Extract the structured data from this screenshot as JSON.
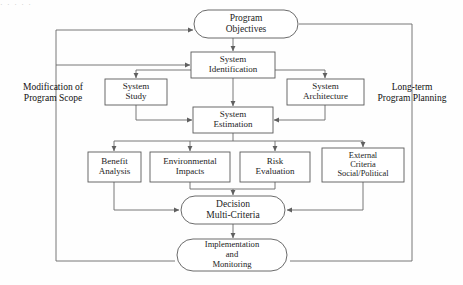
{
  "page": {
    "width": 463,
    "height": 285,
    "background_color": "#fefefe",
    "top_fragment_text": "· ·  ·   ·    ·"
  },
  "colors": {
    "node_stroke": "#5a5a5a",
    "node_fill": "#ffffff",
    "connector": "#6a6a6a",
    "text": "#1c1c1c"
  },
  "diagram": {
    "type": "flowchart",
    "title_visible": false,
    "nodes": [
      {
        "id": "program-objectives",
        "label_lines": [
          "Program",
          "Objectives"
        ],
        "shape": "stadium",
        "x": 194,
        "y": 10,
        "w": 104,
        "h": 28,
        "font_size": 9.5
      },
      {
        "id": "system-identification",
        "label_lines": [
          "System",
          "Identification"
        ],
        "shape": "rect",
        "x": 191,
        "y": 52,
        "w": 84,
        "h": 26,
        "font_size": 9
      },
      {
        "id": "system-study",
        "label_lines": [
          "System",
          "Study"
        ],
        "shape": "rect",
        "x": 105,
        "y": 79,
        "w": 62,
        "h": 26,
        "font_size": 9
      },
      {
        "id": "system-architecture",
        "label_lines": [
          "System",
          "Architecture"
        ],
        "shape": "rect",
        "x": 287,
        "y": 79,
        "w": 77,
        "h": 26,
        "font_size": 9
      },
      {
        "id": "system-estimation",
        "label_lines": [
          "System",
          "Estimation"
        ],
        "shape": "rect",
        "x": 193,
        "y": 107,
        "w": 80,
        "h": 26,
        "font_size": 9
      },
      {
        "id": "benefit-analysis",
        "label_lines": [
          "Benefit",
          "Analysis"
        ],
        "shape": "rect",
        "x": 88,
        "y": 152,
        "w": 53,
        "h": 30,
        "font_size": 9
      },
      {
        "id": "environmental-impacts",
        "label_lines": [
          "Environmental",
          "Impacts"
        ],
        "shape": "rect",
        "x": 150,
        "y": 152,
        "w": 80,
        "h": 30,
        "font_size": 9
      },
      {
        "id": "risk-evaluation",
        "label_lines": [
          "Risk",
          "Evaluation"
        ],
        "shape": "rect",
        "x": 240,
        "y": 152,
        "w": 70,
        "h": 30,
        "font_size": 9
      },
      {
        "id": "external-criteria",
        "label_lines": [
          "External",
          "Criteria",
          "Social/Political"
        ],
        "shape": "rect",
        "x": 322,
        "y": 148,
        "w": 82,
        "h": 34,
        "font_size": 8.4
      },
      {
        "id": "decision-multi-criteria",
        "label_lines": [
          "Decision",
          "Multi-Criteria"
        ],
        "shape": "stadium",
        "x": 181,
        "y": 196,
        "w": 104,
        "h": 28,
        "font_size": 9.5
      },
      {
        "id": "implementation-and-monitoring",
        "label_lines": [
          "Implementation",
          "and",
          "Monitoring"
        ],
        "shape": "stadium",
        "x": 177,
        "y": 239,
        "w": 110,
        "h": 32,
        "font_size": 8.6
      }
    ],
    "side_labels": [
      {
        "id": "modification-of-program-scope",
        "lines": [
          "Modification of",
          "Program Scope"
        ],
        "x": 53,
        "y": 93,
        "font_size": 9.5
      },
      {
        "id": "long-term-program-planning",
        "lines": [
          "Long-term",
          "Program Planning"
        ],
        "x": 412,
        "y": 93,
        "font_size": 9.5
      }
    ],
    "edges": [
      {
        "from": "program-objectives",
        "to": "system-identification",
        "kind": "arrow-down"
      },
      {
        "from": "system-identification",
        "to": "system-estimation",
        "kind": "arrow-down"
      },
      {
        "from": "system-identification",
        "to": "system-study",
        "kind": "branch-left-down"
      },
      {
        "from": "system-identification",
        "to": "system-architecture",
        "kind": "branch-right-down"
      },
      {
        "from": "system-study",
        "to": "system-estimation",
        "kind": "down-into-bus"
      },
      {
        "from": "system-architecture",
        "to": "system-estimation",
        "kind": "down-into-bus"
      },
      {
        "from": "system-estimation",
        "to": "benefit-analysis",
        "kind": "bus-fanout"
      },
      {
        "from": "system-estimation",
        "to": "environmental-impacts",
        "kind": "bus-fanout"
      },
      {
        "from": "system-estimation",
        "to": "risk-evaluation",
        "kind": "bus-fanout"
      },
      {
        "from": "system-estimation",
        "to": "external-criteria",
        "kind": "bus-fanout"
      },
      {
        "from": "environmental-impacts",
        "to": "decision-multi-criteria",
        "kind": "converge-down"
      },
      {
        "from": "risk-evaluation",
        "to": "decision-multi-criteria",
        "kind": "converge-down"
      },
      {
        "from": "benefit-analysis",
        "to": "decision-multi-criteria",
        "kind": "route-left-in"
      },
      {
        "from": "external-criteria",
        "to": "decision-multi-criteria",
        "kind": "route-right-in"
      },
      {
        "from": "decision-multi-criteria",
        "to": "implementation-and-monitoring",
        "kind": "arrow-down"
      },
      {
        "from": "implementation-and-monitoring",
        "to": "program-objectives",
        "kind": "feedback-left-loop"
      },
      {
        "from": "implementation-and-monitoring",
        "to": "system-identification",
        "kind": "feedback-left-loop"
      },
      {
        "from": "program-objectives",
        "to": "implementation-and-monitoring",
        "kind": "feedback-right-loop"
      }
    ]
  }
}
